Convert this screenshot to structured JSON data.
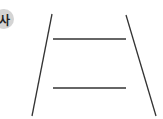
{
  "option_label": "사",
  "figure": {
    "stroke_color": "#333333",
    "left_leg": {
      "x1": 52,
      "y1": 14,
      "x2": 32,
      "y2": 116
    },
    "right_leg": {
      "x1": 126,
      "y1": 15,
      "x2": 156,
      "y2": 116
    },
    "horizontal_lines": [
      {
        "x1": 53,
        "y1": 39,
        "x2": 126,
        "y2": 39
      },
      {
        "x1": 53,
        "y1": 88,
        "x2": 126,
        "y2": 88
      }
    ]
  }
}
